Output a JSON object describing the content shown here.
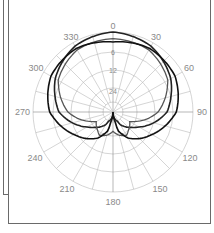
{
  "chart_data": {
    "type": "polar",
    "title": "",
    "angle_unit": "degrees",
    "angle_direction": "clockwise",
    "zero_location": "top",
    "angle_ticks": [
      0,
      30,
      60,
      90,
      120,
      150,
      180,
      210,
      240,
      270,
      300,
      330
    ],
    "angle_tick_labels": [
      "0",
      "30",
      "60",
      "90",
      "120",
      "150",
      "180",
      "210",
      "240",
      "270",
      "300",
      "330"
    ],
    "radial_unit": "dB",
    "radial_rings_db": [
      0,
      6,
      12,
      18,
      24
    ],
    "radial_tick_labels": [
      "6",
      "12",
      "24"
    ],
    "grid": true,
    "legend": null,
    "series": [
      {
        "name": "pattern-1 (cardioid, narrow)",
        "color": "#222222",
        "theta": [
          0,
          30,
          60,
          90,
          120,
          150,
          165,
          180
        ],
        "level_db": [
          0,
          -1.2,
          -4,
          -8,
          -16,
          -22,
          -28,
          -40
        ]
      },
      {
        "name": "pattern-2 (supercardioid)",
        "color": "#555555",
        "theta": [
          0,
          30,
          60,
          90,
          120,
          150,
          165,
          180
        ],
        "level_db": [
          -2,
          -2.5,
          -5,
          -11,
          -20,
          -17,
          -18,
          -20
        ]
      },
      {
        "name": "pattern-3 (wide cardioid, outer)",
        "color": "#111111",
        "theta": [
          0,
          30,
          60,
          90,
          120,
          150,
          165,
          180
        ],
        "level_db": [
          -3,
          -2,
          -2.5,
          -5,
          -11,
          -16,
          -20,
          -40
        ]
      }
    ]
  },
  "labels": {
    "a0": "0",
    "a30": "30",
    "a60": "60",
    "a90": "90",
    "a120": "120",
    "a150": "150",
    "a180": "180",
    "a210": "210",
    "a240": "240",
    "a270": "270",
    "a300": "300",
    "a330": "330",
    "r6": "6",
    "r12": "12",
    "r24": "24"
  }
}
